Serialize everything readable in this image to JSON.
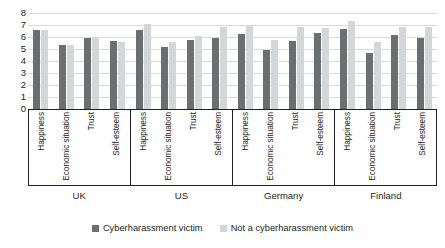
{
  "chart_data": {
    "type": "bar",
    "title": "",
    "subtitle": "",
    "xlabel": "",
    "ylabel": "",
    "ylim": [
      0,
      8
    ],
    "yticks": [
      "8",
      "7",
      "6",
      "5",
      "4",
      "3",
      "2",
      "1",
      "0"
    ],
    "grid": true,
    "legend_position": "bottom-center",
    "categories": [
      "Happiness",
      "Economic situation",
      "Trust",
      "Self-esteem"
    ],
    "groups": [
      "UK",
      "US",
      "Germany",
      "Finland"
    ],
    "series": [
      {
        "name": "Cyberharassment victim",
        "color": "#6d6e70",
        "values_by_group": {
          "UK": [
            6.6,
            5.35,
            5.95,
            5.7
          ],
          "US": [
            6.6,
            5.2,
            5.75,
            5.9
          ],
          "Germany": [
            6.25,
            4.9,
            5.7,
            6.3
          ],
          "Finland": [
            6.7,
            4.7,
            6.15,
            5.9
          ]
        }
      },
      {
        "name": "Not a cyberharassment victim",
        "color": "#d5d6d7",
        "values_by_group": {
          "UK": [
            6.55,
            5.35,
            5.9,
            5.6
          ],
          "US": [
            7.1,
            5.6,
            6.1,
            6.8
          ],
          "Germany": [
            6.95,
            5.75,
            6.8,
            6.75
          ],
          "Finland": [
            7.35,
            5.6,
            6.8,
            6.8
          ]
        }
      }
    ]
  },
  "legend": {
    "items": [
      {
        "label": "Cyberharassment victim",
        "swatch": "victim-swatch"
      },
      {
        "label": "Not a cyberharassment victim",
        "swatch": "nonvictim-swatch"
      }
    ]
  }
}
